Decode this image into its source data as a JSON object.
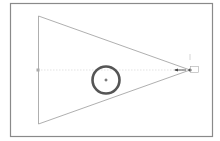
{
  "diagram": {
    "type": "radial-gradient-cone-illustration",
    "colors": {
      "frame": "#8a8a8a",
      "triangle": "#9a9a9a",
      "circle": "#555555",
      "handle": "#777777",
      "center_line": "#c8c8c8"
    },
    "frame": {
      "x": 10,
      "y": 3,
      "w": 203,
      "h": 134
    },
    "triangle": {
      "left_x": 38,
      "top_y": 16,
      "bottom_y": 124,
      "apex_x": 190,
      "apex_y": 70
    },
    "circle": {
      "cx": 106,
      "cy": 80,
      "r": 14
    },
    "left_handle": {
      "x": 38,
      "y": 70
    },
    "apex_handle": {
      "x": 190,
      "y": 70
    }
  }
}
